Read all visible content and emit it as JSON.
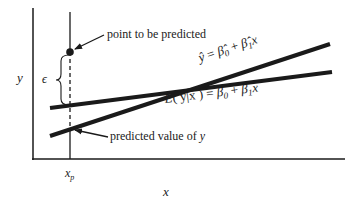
{
  "diagram": {
    "type": "regression-prediction-diagram",
    "axes": {
      "x_label": "x",
      "y_label": "y",
      "x_tick_label": "x",
      "x_tick_subscript": "p"
    },
    "annotations": {
      "point_label": "point to be predicted",
      "predicted_label_prefix": "predicted value of ",
      "predicted_label_var": "y",
      "epsilon": "ϵ"
    },
    "lines": {
      "fitted": {
        "name": "fitted regression line",
        "equation": "ŷ = β̂₀ + β̂₁x",
        "lhs": "ŷ",
        "eq": " = ",
        "b0": "β̂",
        "b0_sub": "0",
        "plus": " + ",
        "b1": "β̂",
        "b1_sub": "1",
        "x": "x"
      },
      "population": {
        "name": "population regression line",
        "equation": "E(y|x) = β₀ + β₁x",
        "lhs": "E",
        "paren": "( y|x )",
        "eq": " = ",
        "b0": "β",
        "b0_sub": "0",
        "plus": " + ",
        "b1": "β",
        "b1_sub": "1",
        "x": "x"
      }
    },
    "colors": {
      "ink": "#1a1a1a",
      "background": "#ffffff"
    }
  }
}
